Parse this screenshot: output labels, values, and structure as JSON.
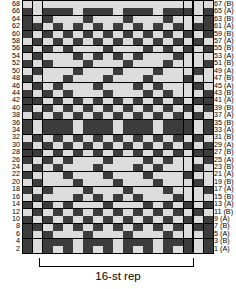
{
  "chart_title": "",
  "legend": {
    "dark_color": "#3c3c3c",
    "light_color": "#dcdcdc",
    "grid_color": "#000000"
  },
  "repeat": {
    "label": "16-st rep",
    "stitches": 16,
    "start_column": 2,
    "end_column": 17
  },
  "axes": {
    "left_labels": [
      "68",
      "66",
      "64",
      "62",
      "60",
      "58",
      "56",
      "54",
      "52",
      "50",
      "48",
      "46",
      "44",
      "42",
      "40",
      "38",
      "36",
      "34",
      "32",
      "30",
      "28",
      "26",
      "24",
      "22",
      "20",
      "18",
      "16",
      "14",
      "12",
      "10",
      "8",
      "6",
      "4",
      "2"
    ],
    "right_labels": [
      "67 (B)",
      "65 (A)",
      "63 (B)",
      "61 (A)",
      "59 (B)",
      "57 (A)",
      "55 (B)",
      "53 (A)",
      "51 (B)",
      "49 (A)",
      "47 (B)",
      "45 (A)",
      "43 (B)",
      "41 (A)",
      "39 (B)",
      "37 (A)",
      "35 (B)",
      "33 (A)",
      "31 (B)",
      "29 (A)",
      "27 (B)",
      "25 (A)",
      "23 (B)",
      "21 (A)",
      "19 (B)",
      "17 (A)",
      "15 (B)",
      "13 (A)",
      "11 (B)",
      "9 (A)",
      "7 (B)",
      "5 (A)",
      "3 (B)",
      "1 (A)"
    ]
  },
  "chart_data": {
    "type": "heatmap",
    "title": "",
    "xlabel": "16-st rep",
    "ylabel": "",
    "columns": 19,
    "rows": 34,
    "value_map": {
      "1": "dark",
      "0": "light"
    },
    "row_order": "top-to-bottom (row 68/67 at top, row 2/1 at bottom)",
    "grid": [
      "0000000000000000000",
      "1011101110111011101",
      "1010001000100010001",
      "1101010101010101011",
      "1010101010101010101",
      "0101010101010101010",
      "1010100010001010101",
      "0100010101010001000",
      "1010001000100010001",
      "0100010001000100010",
      "1000100010001000100",
      "0101000100010100010",
      "1010100010001010001",
      "1101010101010101011",
      "1010101010101010101",
      "0101010101010101010",
      "1011101110111011101",
      "1011101110111011101",
      "0101010101010101010",
      "1010101010101010101",
      "1101010101010101011",
      "1010100010001010001",
      "0101000100010100010",
      "1000100010001000100",
      "0100010001000100010",
      "1010001000100010001",
      "0100010101010001000",
      "1010100010001010101",
      "0101010101010101010",
      "1010101010101010101",
      "1101010101010101011",
      "1010001000100010001",
      "1011101110111011101",
      "1010101010101010101"
    ]
  }
}
